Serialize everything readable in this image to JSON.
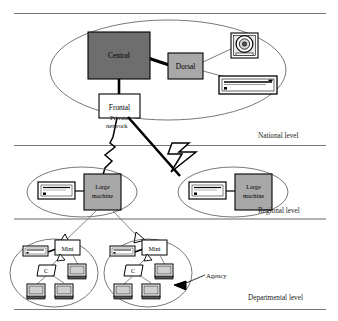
{
  "figure": {
    "background_color": "#ffffff",
    "line_color": "#000000"
  },
  "levels": [
    {
      "id": "national",
      "label": "National level"
    },
    {
      "id": "regional",
      "label": "Regional level"
    },
    {
      "id": "departmental",
      "label": "Departmental level"
    }
  ],
  "national": {
    "central": {
      "label": "Central",
      "fill": "#6e6e6e"
    },
    "dorsal": {
      "label": "Dorsal",
      "fill": "#a8a8a8"
    },
    "frontal": {
      "label": "Frontal",
      "fill": "#ffffff"
    },
    "peripherals": [
      {
        "id": "tape-drive",
        "icon": "tape-drive-icon"
      },
      {
        "id": "rack-unit",
        "icon": "rack-unit-icon"
      }
    ]
  },
  "network": {
    "private_network_label_line1": "Private",
    "private_network_label_line2": "network"
  },
  "regional": {
    "sites": [
      {
        "machine_label_line1": "Large",
        "machine_label_line2": "machine",
        "fill": "#a8a8a8",
        "printer_icon": "printer-icon"
      },
      {
        "machine_label_line1": "Large",
        "machine_label_line2": "machine",
        "fill": "#a8a8a8",
        "printer_icon": "printer-icon"
      }
    ]
  },
  "departmental": {
    "agency_label": "Agency",
    "sites": [
      {
        "mini_label": "Mini",
        "concentrator_label": "C",
        "printer_icon": "printer-icon",
        "terminals": 3
      },
      {
        "mini_label": "Mini",
        "concentrator_label": "C",
        "printer_icon": "printer-icon",
        "terminals": 3
      }
    ]
  }
}
